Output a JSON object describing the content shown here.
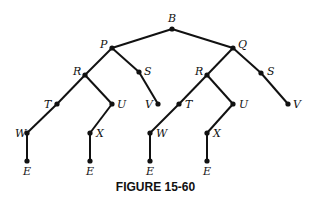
{
  "diagram": {
    "type": "tree",
    "caption": "FIGURE 15-60",
    "nodes": [
      {
        "id": "n1",
        "label": "B",
        "x": 172,
        "y": 29,
        "lx": 168,
        "ly": 22
      },
      {
        "id": "n2",
        "label": "P",
        "x": 112,
        "y": 48,
        "lx": 100,
        "ly": 48
      },
      {
        "id": "n3",
        "label": "Q",
        "x": 233,
        "y": 48,
        "lx": 238,
        "ly": 48
      },
      {
        "id": "n4",
        "label": "R",
        "x": 85,
        "y": 75,
        "lx": 73,
        "ly": 75
      },
      {
        "id": "n5",
        "label": "S",
        "x": 139,
        "y": 72,
        "lx": 144,
        "ly": 75
      },
      {
        "id": "n6",
        "label": "R",
        "x": 207,
        "y": 75,
        "lx": 195,
        "ly": 75
      },
      {
        "id": "n7",
        "label": "S",
        "x": 261,
        "y": 73,
        "lx": 267,
        "ly": 75
      },
      {
        "id": "n8",
        "label": "T",
        "x": 57,
        "y": 104,
        "lx": 44,
        "ly": 108
      },
      {
        "id": "n9",
        "label": "U",
        "x": 112,
        "y": 104,
        "lx": 117,
        "ly": 108
      },
      {
        "id": "n10",
        "label": "V",
        "x": 158,
        "y": 104,
        "lx": 145,
        "ly": 108
      },
      {
        "id": "n11",
        "label": "T",
        "x": 179,
        "y": 104,
        "lx": 185,
        "ly": 108
      },
      {
        "id": "n12",
        "label": "U",
        "x": 233,
        "y": 104,
        "lx": 239,
        "ly": 108
      },
      {
        "id": "n13",
        "label": "V",
        "x": 288,
        "y": 104,
        "lx": 293,
        "ly": 108
      },
      {
        "id": "n14",
        "label": "W",
        "x": 27,
        "y": 133,
        "lx": 15,
        "ly": 137
      },
      {
        "id": "n15",
        "label": "X",
        "x": 90,
        "y": 133,
        "lx": 96,
        "ly": 137
      },
      {
        "id": "n16",
        "label": "W",
        "x": 150,
        "y": 133,
        "lx": 156,
        "ly": 137
      },
      {
        "id": "n17",
        "label": "X",
        "x": 207,
        "y": 133,
        "lx": 213,
        "ly": 137
      },
      {
        "id": "n18",
        "label": "E",
        "x": 27,
        "y": 161,
        "lx": 23,
        "ly": 175
      },
      {
        "id": "n19",
        "label": "E",
        "x": 90,
        "y": 161,
        "lx": 86,
        "ly": 175
      },
      {
        "id": "n20",
        "label": "E",
        "x": 150,
        "y": 161,
        "lx": 146,
        "ly": 175
      },
      {
        "id": "n21",
        "label": "E",
        "x": 207,
        "y": 161,
        "lx": 203,
        "ly": 175
      }
    ],
    "edges": [
      [
        "n1",
        "n2"
      ],
      [
        "n1",
        "n3"
      ],
      [
        "n2",
        "n4"
      ],
      [
        "n2",
        "n5"
      ],
      [
        "n5",
        "n10"
      ],
      [
        "n3",
        "n6"
      ],
      [
        "n3",
        "n7"
      ],
      [
        "n7",
        "n13"
      ],
      [
        "n4",
        "n8"
      ],
      [
        "n4",
        "n9"
      ],
      [
        "n8",
        "n14"
      ],
      [
        "n14",
        "n18"
      ],
      [
        "n9",
        "n15"
      ],
      [
        "n15",
        "n19"
      ],
      [
        "n6",
        "n11"
      ],
      [
        "n6",
        "n12"
      ],
      [
        "n11",
        "n16"
      ],
      [
        "n16",
        "n20"
      ],
      [
        "n12",
        "n17"
      ],
      [
        "n17",
        "n21"
      ]
    ]
  }
}
